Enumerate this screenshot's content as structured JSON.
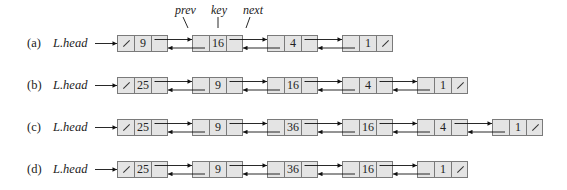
{
  "field_labels": {
    "prev": "prev",
    "key": "key",
    "next": "next"
  },
  "colors": {
    "cell_fill": "#e4e4e4",
    "cell_border": "#7a7a7a",
    "arrow": "#111111"
  },
  "rows": [
    {
      "label": "(a)",
      "head": "L.head",
      "keys": [
        "9",
        "16",
        "4",
        "1"
      ]
    },
    {
      "label": "(b)",
      "head": "L.head",
      "keys": [
        "25",
        "9",
        "16",
        "4",
        "1"
      ]
    },
    {
      "label": "(c)",
      "head": "L.head",
      "keys": [
        "25",
        "9",
        "36",
        "16",
        "4",
        "1"
      ]
    },
    {
      "label": "(d)",
      "head": "L.head",
      "keys": [
        "25",
        "9",
        "36",
        "16",
        "1"
      ]
    }
  ]
}
